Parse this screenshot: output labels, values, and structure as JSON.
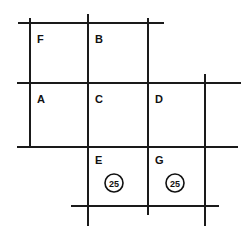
{
  "diagram": {
    "background_color": "#ffffff",
    "line_color": "#1a1a1a",
    "text_color": "#111111",
    "width": 251,
    "height": 233,
    "lines": [
      {
        "name": "vertical-line-1",
        "orientation": "vertical",
        "x1": 30,
        "y1": 18,
        "x2": 30,
        "y2": 148
      },
      {
        "name": "vertical-line-2",
        "orientation": "vertical",
        "x1": 88,
        "y1": 14,
        "x2": 88,
        "y2": 226
      },
      {
        "name": "vertical-line-3",
        "orientation": "vertical",
        "x1": 148,
        "y1": 18,
        "x2": 148,
        "y2": 215
      },
      {
        "name": "vertical-line-4",
        "orientation": "vertical",
        "x1": 205,
        "y1": 74,
        "x2": 205,
        "y2": 226
      },
      {
        "name": "horizontal-line-1",
        "orientation": "horizontal",
        "x1": 18,
        "y1": 23,
        "x2": 164,
        "y2": 23
      },
      {
        "name": "horizontal-line-2",
        "orientation": "horizontal",
        "x1": 17,
        "y1": 83,
        "x2": 241,
        "y2": 83
      },
      {
        "name": "horizontal-line-3",
        "orientation": "horizontal",
        "x1": 17,
        "y1": 147,
        "x2": 238,
        "y2": 147
      },
      {
        "name": "horizontal-line-4",
        "orientation": "horizontal",
        "x1": 71,
        "y1": 206,
        "x2": 219,
        "y2": 206
      }
    ],
    "labels": [
      {
        "name": "label-f",
        "text": "F",
        "x": 37,
        "y": 40
      },
      {
        "name": "label-b",
        "text": "B",
        "x": 95,
        "y": 40
      },
      {
        "name": "label-a",
        "text": "A",
        "x": 37,
        "y": 100
      },
      {
        "name": "label-c",
        "text": "C",
        "x": 95,
        "y": 100
      },
      {
        "name": "label-d",
        "text": "D",
        "x": 155,
        "y": 100
      },
      {
        "name": "label-e",
        "text": "E",
        "x": 95,
        "y": 161
      },
      {
        "name": "label-g",
        "text": "G",
        "x": 155,
        "y": 161
      }
    ],
    "tokens": [
      {
        "name": "token-25-under-e",
        "text": "25",
        "cx": 114,
        "cy": 183,
        "r": 9
      },
      {
        "name": "token-25-under-g",
        "text": "25",
        "cx": 175,
        "cy": 183,
        "r": 9
      }
    ]
  }
}
